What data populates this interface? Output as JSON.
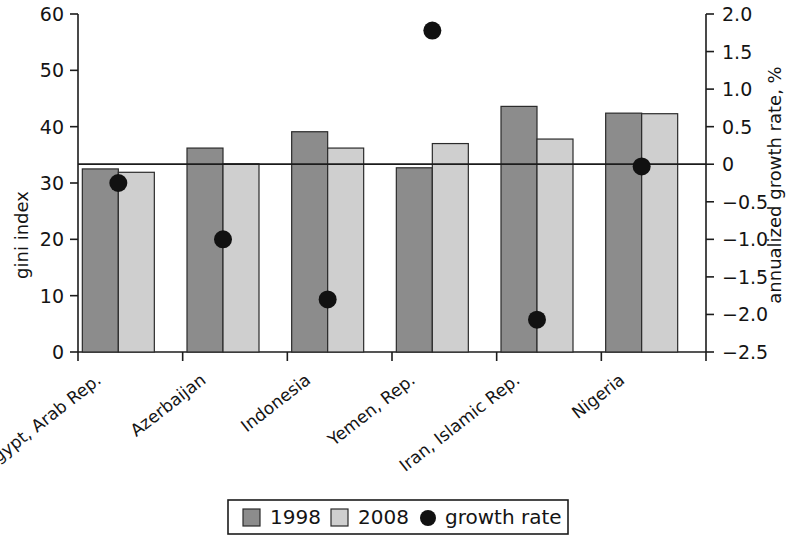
{
  "chart_data": {
    "type": "bar",
    "title": "",
    "subtitle": "",
    "categories": [
      "Egypt, Arab Rep.",
      "Azerbaijan",
      "Indonesia",
      "Yemen, Rep.",
      "Iran, Islamic Rep.",
      "Nigeria"
    ],
    "series": [
      {
        "name": "1998",
        "values": [
          32.5,
          36.2,
          39.1,
          32.7,
          43.6,
          42.4
        ],
        "color": "#8c8c8c",
        "axis": "left"
      },
      {
        "name": "2008",
        "values": [
          31.9,
          33.4,
          36.2,
          37.0,
          37.8,
          42.3
        ],
        "color": "#cfcfcf",
        "axis": "left"
      },
      {
        "name": "growth rate",
        "values": [
          -0.25,
          -1.0,
          -1.8,
          1.78,
          -2.07,
          -0.03
        ],
        "color": "#111111",
        "axis": "right",
        "marker": "circle"
      }
    ],
    "ylabel": "gini index",
    "ylim": [
      0,
      60
    ],
    "yticks": [
      "0",
      "10",
      "20",
      "30",
      "40",
      "50",
      "60"
    ],
    "y2label": "annualized growth rate, %",
    "y2lim": [
      -2.5,
      2.0
    ],
    "y2ticks": [
      "2.0",
      "1.5",
      "1.0",
      "0.5",
      "0",
      "-0.5",
      "-1.0",
      "-1.5",
      "-2.0",
      "-2.5"
    ],
    "xlabel": "",
    "grid": false,
    "zero_reference_line": true,
    "legend_position": "bottom",
    "legend": [
      {
        "label": "1998",
        "type": "swatch",
        "color": "#8c8c8c"
      },
      {
        "label": "2008",
        "type": "swatch",
        "color": "#cfcfcf"
      },
      {
        "label": "growth rate",
        "type": "dot",
        "color": "#111111"
      }
    ]
  },
  "axes": {
    "left": {
      "title": "gini index",
      "ticks": [
        "60",
        "50",
        "40",
        "30",
        "20",
        "10",
        "0"
      ]
    },
    "right": {
      "title": "annualized growth rate, %",
      "ticks": [
        "2.0",
        "1.5",
        "1.0",
        "0.5",
        "0",
        "−0.5",
        "−1.0",
        "−1.5",
        "−2.0",
        "−2.5"
      ]
    },
    "categories": [
      "Egypt, Arab Rep.",
      "Azerbaijan",
      "Indonesia",
      "Yemen, Rep.",
      "Iran, Islamic Rep.",
      "Nigeria"
    ]
  },
  "legend": {
    "items": [
      {
        "label": "1998"
      },
      {
        "label": "2008"
      },
      {
        "label": "growth rate"
      }
    ]
  },
  "colors": {
    "series_1998": "#8c8c8c",
    "series_2008": "#cfcfcf",
    "growth_marker": "#111111",
    "axis": "#1c1c1c",
    "background": "#ffffff"
  }
}
